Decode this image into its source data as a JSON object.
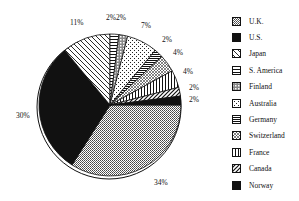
{
  "chart_data": {
    "type": "pie",
    "title": "",
    "start_angle_deg": 0,
    "direction": "clockwise",
    "slices": [
      {
        "label": "U.K.",
        "value": 34,
        "display": "34%",
        "pattern": "dots"
      },
      {
        "label": "U.S.",
        "value": 30,
        "display": "30%",
        "pattern": "solid"
      },
      {
        "label": "Japan",
        "value": 11,
        "display": "11%",
        "pattern": "diag-back"
      },
      {
        "label": "S. America",
        "value": 2,
        "display": "2%",
        "pattern": "horizontal"
      },
      {
        "label": "Finland",
        "value": 2,
        "display": "2%",
        "pattern": "check"
      },
      {
        "label": "Australia",
        "value": 7,
        "display": "7%",
        "pattern": "sparse-dots"
      },
      {
        "label": "Germany",
        "value": 2,
        "display": "2%",
        "pattern": "dense-horizontal"
      },
      {
        "label": "Switzerland",
        "value": 4,
        "display": "4%",
        "pattern": "crosshatch"
      },
      {
        "label": "France",
        "value": 4,
        "display": "4%",
        "pattern": "vertical"
      },
      {
        "label": "Canada",
        "value": 2,
        "display": "2%",
        "pattern": "diag-fwd"
      },
      {
        "label": "Norway",
        "value": 2,
        "display": "2%",
        "pattern": "solid"
      }
    ],
    "legend_position": "right",
    "legend": [
      "U.K.",
      "U.S.",
      "Japan",
      "S. America",
      "Finland",
      "Australia",
      "Germany",
      "Switzerland",
      "France",
      "Canada",
      "Norway"
    ]
  },
  "labels": {
    "uk": "34%",
    "us": "30%",
    "japan": "11%",
    "samerica": "2%",
    "finland": "2%",
    "australia": "7%",
    "germany": "2%",
    "switzerland": "4%",
    "france": "4%",
    "canada": "2%",
    "norway": "2%"
  }
}
